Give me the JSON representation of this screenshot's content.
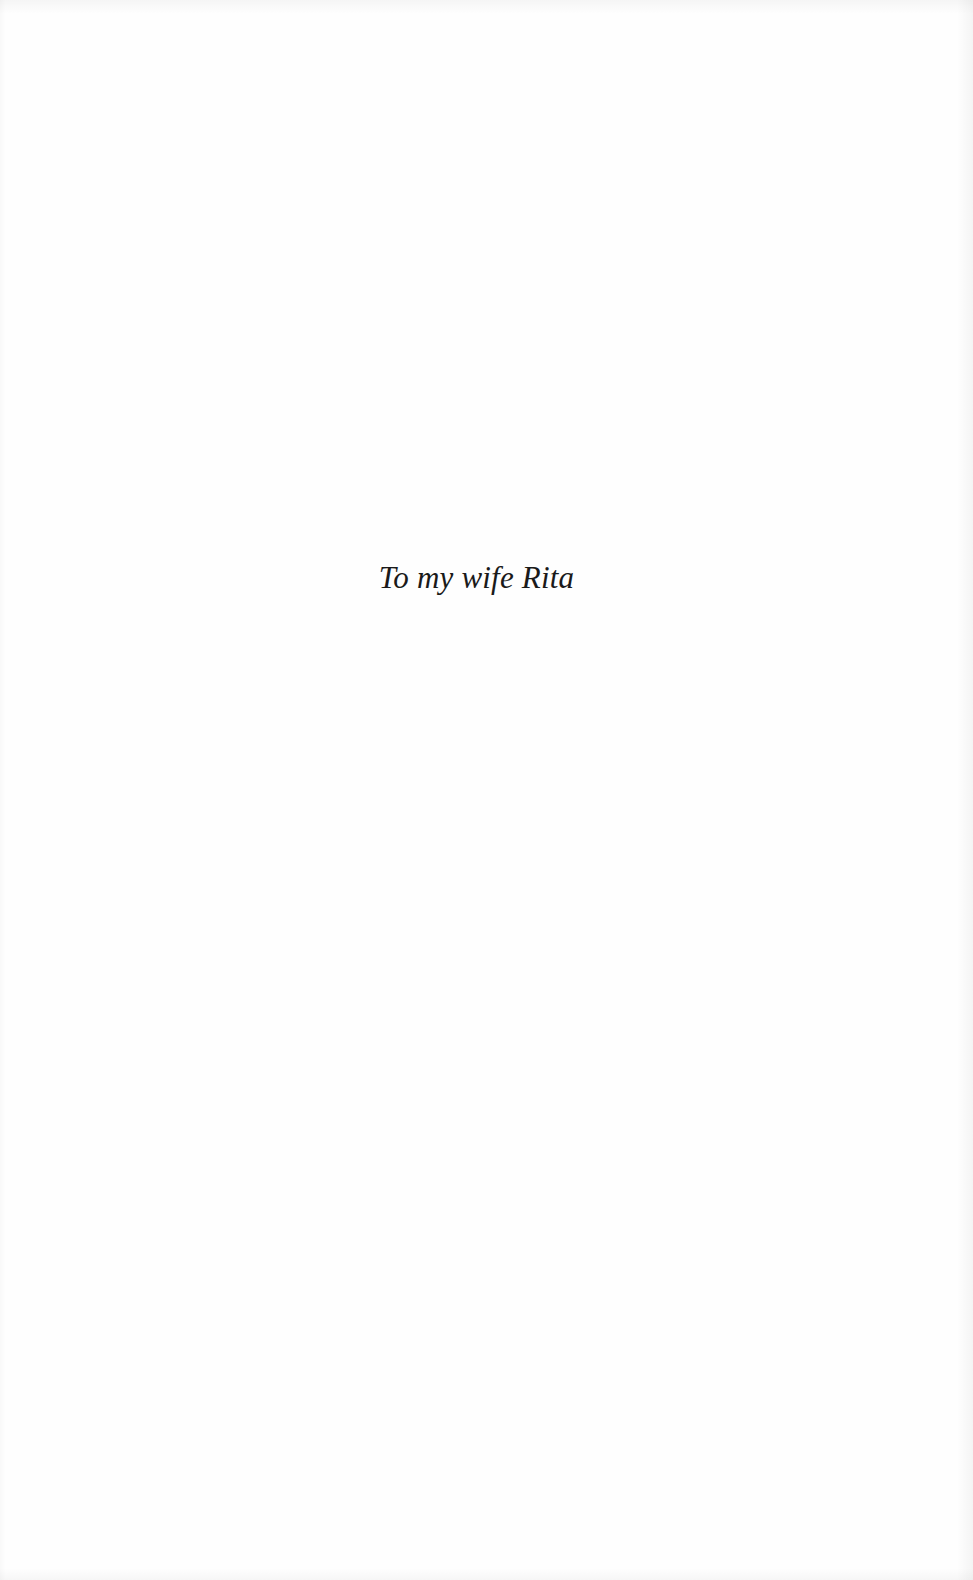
{
  "page": {
    "type": "dedication",
    "background_color": "#fefefe",
    "text_color": "#1a1a1a"
  },
  "dedication": {
    "text": "To my wife Rita"
  }
}
